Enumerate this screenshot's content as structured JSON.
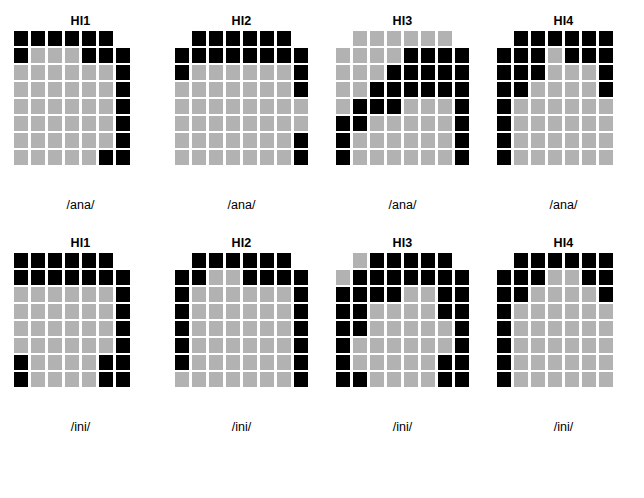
{
  "figure": {
    "colors": {
      "filled_dark": "#000000",
      "filled_light": "#b2b2b2",
      "background": "#ffffff"
    },
    "legend_note": ""
  },
  "chart_data": {
    "type": "heatmap",
    "title": "",
    "xlabel": "",
    "ylabel": "",
    "grid": false,
    "rows": 8,
    "cols": 8,
    "value_map": {
      "0": "empty",
      "1": "light-gray",
      "2": "black"
    },
    "panels": [
      {
        "title": "HI1",
        "label": "/ana/",
        "row": 1,
        "col": 1,
        "matrix": [
          [
            2,
            2,
            2,
            2,
            2,
            2,
            0,
            0
          ],
          [
            2,
            1,
            1,
            1,
            2,
            2,
            2,
            0
          ],
          [
            1,
            1,
            1,
            1,
            1,
            1,
            2,
            0
          ],
          [
            1,
            1,
            1,
            1,
            1,
            1,
            2,
            0
          ],
          [
            1,
            1,
            1,
            1,
            1,
            1,
            2,
            0
          ],
          [
            1,
            1,
            1,
            1,
            1,
            1,
            2,
            0
          ],
          [
            1,
            1,
            1,
            1,
            1,
            1,
            2,
            0
          ],
          [
            1,
            1,
            1,
            1,
            1,
            2,
            2,
            0
          ]
        ]
      },
      {
        "title": "HI2",
        "label": "/ana/",
        "row": 1,
        "col": 2,
        "matrix": [
          [
            0,
            2,
            2,
            2,
            2,
            2,
            2,
            0
          ],
          [
            2,
            2,
            2,
            2,
            2,
            2,
            2,
            2
          ],
          [
            2,
            1,
            1,
            1,
            1,
            1,
            1,
            2
          ],
          [
            1,
            1,
            1,
            1,
            1,
            1,
            1,
            2
          ],
          [
            1,
            1,
            1,
            1,
            1,
            1,
            1,
            1
          ],
          [
            1,
            1,
            1,
            1,
            1,
            1,
            1,
            1
          ],
          [
            1,
            1,
            1,
            1,
            1,
            1,
            1,
            2
          ],
          [
            1,
            1,
            1,
            1,
            1,
            1,
            1,
            2
          ]
        ]
      },
      {
        "title": "HI3",
        "label": "/ana/",
        "row": 1,
        "col": 3,
        "matrix": [
          [
            0,
            1,
            1,
            1,
            1,
            1,
            1,
            0
          ],
          [
            1,
            1,
            1,
            1,
            2,
            2,
            2,
            2
          ],
          [
            1,
            1,
            1,
            2,
            2,
            2,
            2,
            2
          ],
          [
            1,
            1,
            2,
            2,
            2,
            2,
            2,
            2
          ],
          [
            1,
            2,
            2,
            2,
            1,
            1,
            1,
            2
          ],
          [
            2,
            2,
            1,
            1,
            1,
            1,
            1,
            2
          ],
          [
            2,
            1,
            1,
            1,
            1,
            1,
            1,
            2
          ],
          [
            2,
            1,
            1,
            1,
            1,
            1,
            1,
            2
          ]
        ]
      },
      {
        "title": "HI4",
        "label": "/ana/",
        "row": 1,
        "col": 4,
        "matrix": [
          [
            0,
            2,
            2,
            2,
            2,
            2,
            2,
            0
          ],
          [
            2,
            2,
            2,
            1,
            2,
            2,
            2,
            0
          ],
          [
            2,
            2,
            2,
            1,
            1,
            1,
            2,
            0
          ],
          [
            2,
            2,
            1,
            1,
            1,
            1,
            2,
            0
          ],
          [
            2,
            1,
            1,
            1,
            1,
            1,
            1,
            0
          ],
          [
            2,
            1,
            1,
            1,
            1,
            1,
            1,
            0
          ],
          [
            2,
            1,
            1,
            1,
            1,
            1,
            1,
            0
          ],
          [
            2,
            1,
            1,
            1,
            1,
            1,
            1,
            0
          ]
        ]
      },
      {
        "title": "HI1",
        "label": "/ini/",
        "row": 2,
        "col": 1,
        "matrix": [
          [
            2,
            2,
            2,
            2,
            2,
            2,
            0,
            0
          ],
          [
            2,
            2,
            2,
            2,
            2,
            2,
            2,
            0
          ],
          [
            1,
            1,
            1,
            1,
            1,
            1,
            2,
            0
          ],
          [
            1,
            1,
            1,
            1,
            1,
            1,
            2,
            0
          ],
          [
            1,
            1,
            1,
            1,
            1,
            1,
            2,
            0
          ],
          [
            1,
            1,
            1,
            1,
            1,
            1,
            2,
            0
          ],
          [
            2,
            1,
            1,
            1,
            1,
            2,
            2,
            0
          ],
          [
            2,
            1,
            1,
            1,
            1,
            2,
            2,
            0
          ]
        ]
      },
      {
        "title": "HI2",
        "label": "/ini/",
        "row": 2,
        "col": 2,
        "matrix": [
          [
            0,
            2,
            2,
            2,
            2,
            2,
            2,
            0
          ],
          [
            2,
            2,
            1,
            1,
            2,
            2,
            2,
            2
          ],
          [
            2,
            1,
            1,
            1,
            1,
            1,
            1,
            2
          ],
          [
            2,
            1,
            1,
            1,
            1,
            1,
            1,
            2
          ],
          [
            2,
            1,
            1,
            1,
            1,
            1,
            1,
            2
          ],
          [
            2,
            1,
            1,
            1,
            1,
            1,
            1,
            2
          ],
          [
            2,
            1,
            1,
            1,
            1,
            1,
            1,
            2
          ],
          [
            1,
            1,
            1,
            1,
            1,
            1,
            1,
            2
          ]
        ]
      },
      {
        "title": "HI3",
        "label": "/ini/",
        "row": 2,
        "col": 3,
        "matrix": [
          [
            0,
            1,
            2,
            2,
            2,
            2,
            2,
            0
          ],
          [
            1,
            2,
            2,
            2,
            2,
            2,
            2,
            2
          ],
          [
            2,
            2,
            2,
            2,
            1,
            1,
            2,
            2
          ],
          [
            2,
            2,
            1,
            1,
            1,
            1,
            2,
            2
          ],
          [
            2,
            2,
            1,
            1,
            1,
            1,
            1,
            2
          ],
          [
            2,
            1,
            1,
            1,
            1,
            1,
            1,
            2
          ],
          [
            2,
            1,
            1,
            1,
            1,
            1,
            2,
            2
          ],
          [
            2,
            2,
            1,
            1,
            1,
            1,
            2,
            2
          ]
        ]
      },
      {
        "title": "HI4",
        "label": "/ini/",
        "row": 2,
        "col": 4,
        "matrix": [
          [
            0,
            2,
            2,
            2,
            2,
            2,
            2,
            0
          ],
          [
            2,
            2,
            2,
            1,
            1,
            2,
            2,
            0
          ],
          [
            2,
            2,
            1,
            1,
            1,
            1,
            2,
            0
          ],
          [
            2,
            1,
            1,
            1,
            1,
            1,
            1,
            0
          ],
          [
            2,
            1,
            1,
            1,
            1,
            1,
            1,
            0
          ],
          [
            2,
            1,
            1,
            1,
            1,
            1,
            1,
            0
          ],
          [
            2,
            1,
            1,
            1,
            1,
            1,
            1,
            0
          ],
          [
            2,
            1,
            1,
            1,
            1,
            1,
            1,
            0
          ]
        ]
      }
    ]
  }
}
